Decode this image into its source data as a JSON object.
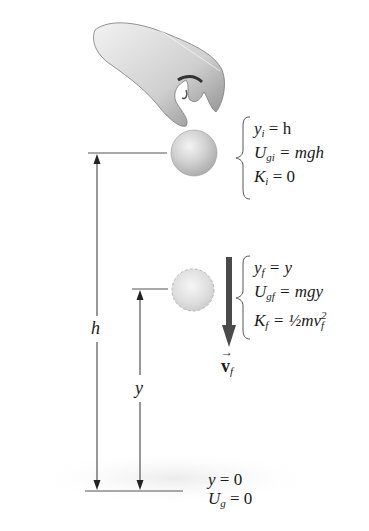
{
  "diagram": {
    "initial_state": {
      "lines": [
        {
          "var": "y",
          "sub": "i",
          "rhs": "= h"
        },
        {
          "var": "U",
          "sub": "gi",
          "rhs": "= mgh"
        },
        {
          "var": "K",
          "sub": "i",
          "rhs": "= 0"
        }
      ]
    },
    "final_state": {
      "lines": [
        {
          "var": "y",
          "sub": "f",
          "rhs": "= y"
        },
        {
          "var": "U",
          "sub": "gf",
          "rhs": "= mgy"
        },
        {
          "var": "K",
          "sub": "f",
          "rhs": "= ½mv",
          "rhs_sub": "f",
          "rhs_sup": "2"
        }
      ]
    },
    "velocity_label": {
      "symbol": "v",
      "sub": "f",
      "arrow": "→"
    },
    "height_labels": {
      "h": "h",
      "y": "y"
    },
    "ground": {
      "lines": [
        {
          "var": "y",
          "sub": "",
          "rhs": "= 0"
        },
        {
          "var": "U",
          "sub": "g",
          "rhs": "= 0"
        }
      ]
    },
    "colors": {
      "ball": "#c8c8c8",
      "arrow": "#4a4a4a",
      "lines": "#333333",
      "text": "#1a1a1a"
    }
  }
}
